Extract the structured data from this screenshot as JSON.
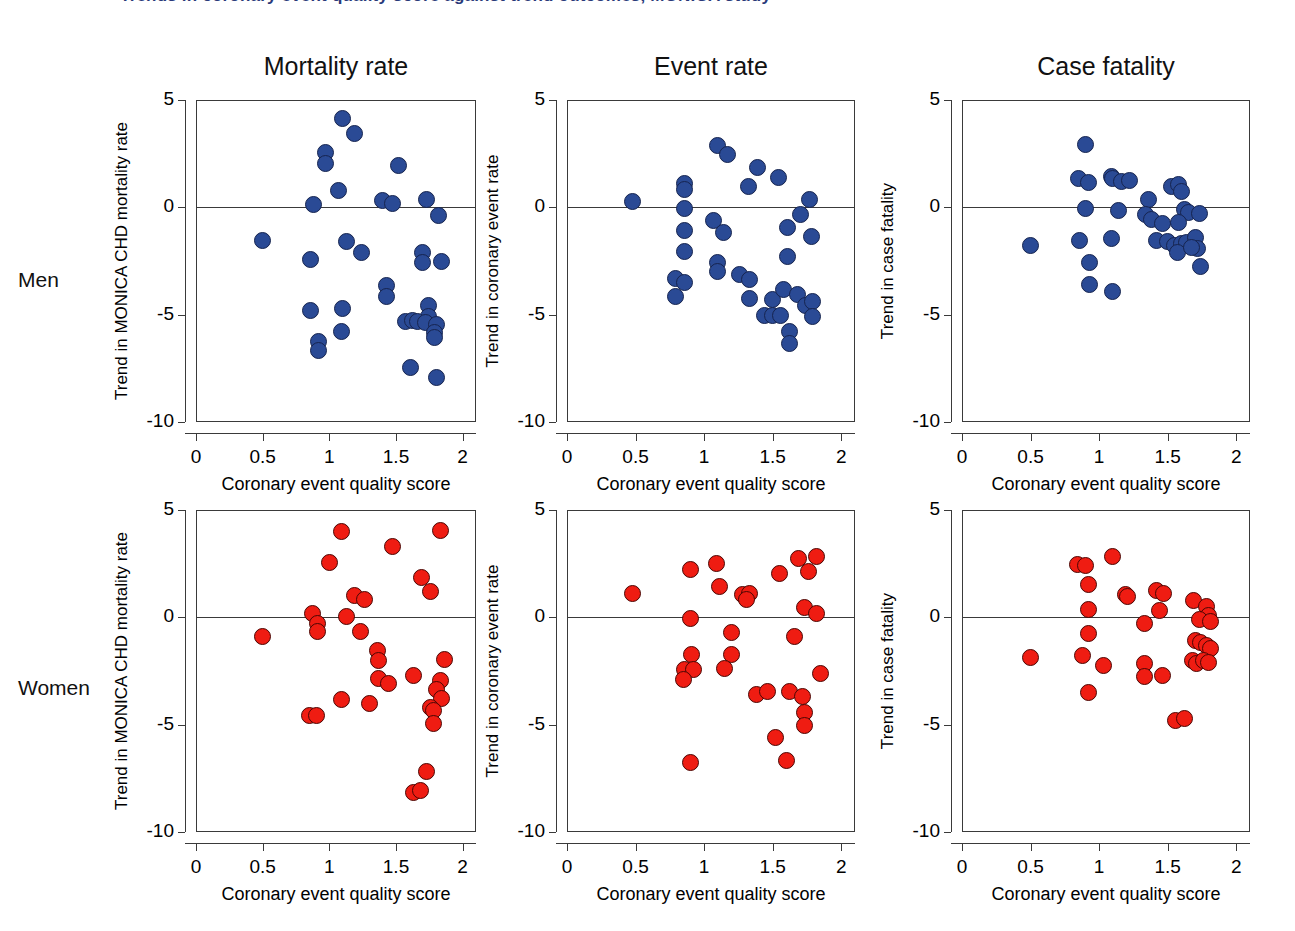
{
  "figure": {
    "clipped_title": "Trends in coronary event quality score against trend outcomes, MONICA study",
    "row_labels": [
      "Men",
      "Women"
    ],
    "column_titles": [
      "Mortality rate",
      "Event rate",
      "Case fatality"
    ],
    "colors": {
      "men": "#2a4a95",
      "men_edge": "#16244f",
      "women": "#ef1c12",
      "women_edge": "#4a0603",
      "axis": "#3a3a3a"
    }
  },
  "axes": {
    "xlabel": "Coronary event quality score",
    "xticks": [
      "0",
      "0.5",
      "1",
      "1.5",
      "2"
    ],
    "xtick_values": [
      0,
      0.5,
      1,
      1.5,
      2
    ],
    "xlim": [
      0,
      2.1
    ],
    "yticks": [
      "5",
      "0",
      "-5",
      "-10"
    ],
    "ytick_values": [
      5,
      0,
      -5,
      -10
    ],
    "ylim": [
      -10,
      5
    ],
    "ylabels": [
      "Trend in MONICA CHD mortality rate",
      "Trend in coronary event rate",
      "Trend in case fatality"
    ]
  },
  "chart_data": [
    {
      "type": "scatter",
      "title": "Mortality rate",
      "group": "Men",
      "color": "#2a4a95",
      "xlabel": "Coronary event quality score",
      "ylabel": "Trend in MONICA CHD mortality rate",
      "xlim": [
        0,
        2.1
      ],
      "ylim": [
        -10,
        5
      ],
      "grid": false,
      "legend": "none",
      "points": [
        {
          "x": 1.1,
          "y": 4.15
        },
        {
          "x": 1.19,
          "y": 3.45
        },
        {
          "x": 0.97,
          "y": 2.55
        },
        {
          "x": 0.97,
          "y": 2.05
        },
        {
          "x": 1.07,
          "y": 0.8
        },
        {
          "x": 1.52,
          "y": 1.95
        },
        {
          "x": 0.88,
          "y": 0.15
        },
        {
          "x": 1.4,
          "y": 0.3
        },
        {
          "x": 1.47,
          "y": 0.2
        },
        {
          "x": 1.73,
          "y": 0.35
        },
        {
          "x": 1.82,
          "y": -0.4
        },
        {
          "x": 0.5,
          "y": -1.55
        },
        {
          "x": 1.13,
          "y": -1.6
        },
        {
          "x": 1.24,
          "y": -2.1
        },
        {
          "x": 0.86,
          "y": -2.45
        },
        {
          "x": 1.7,
          "y": -2.1
        },
        {
          "x": 1.7,
          "y": -2.55
        },
        {
          "x": 1.84,
          "y": -2.5
        },
        {
          "x": 1.43,
          "y": -3.65
        },
        {
          "x": 1.43,
          "y": -4.15
        },
        {
          "x": 0.86,
          "y": -4.8
        },
        {
          "x": 1.1,
          "y": -4.7
        },
        {
          "x": 1.74,
          "y": -4.55
        },
        {
          "x": 1.74,
          "y": -5.1
        },
        {
          "x": 1.57,
          "y": -5.3
        },
        {
          "x": 1.62,
          "y": -5.25
        },
        {
          "x": 1.66,
          "y": -5.3
        },
        {
          "x": 1.72,
          "y": -5.35
        },
        {
          "x": 1.8,
          "y": -5.45
        },
        {
          "x": 1.79,
          "y": -5.85
        },
        {
          "x": 1.79,
          "y": -6.05
        },
        {
          "x": 0.92,
          "y": -6.25
        },
        {
          "x": 0.92,
          "y": -6.65
        },
        {
          "x": 1.09,
          "y": -5.8
        },
        {
          "x": 1.61,
          "y": -7.45
        },
        {
          "x": 1.8,
          "y": -7.95
        }
      ]
    },
    {
      "type": "scatter",
      "title": "Event rate",
      "group": "Men",
      "color": "#2a4a95",
      "xlabel": "Coronary event quality score",
      "ylabel": "Trend in coronary event rate",
      "xlim": [
        0,
        2.1
      ],
      "ylim": [
        -10,
        5
      ],
      "grid": false,
      "legend": "none",
      "points": [
        {
          "x": 1.1,
          "y": 2.9
        },
        {
          "x": 1.17,
          "y": 2.45
        },
        {
          "x": 1.39,
          "y": 1.85
        },
        {
          "x": 1.54,
          "y": 1.4
        },
        {
          "x": 1.32,
          "y": 0.95
        },
        {
          "x": 0.86,
          "y": 1.1
        },
        {
          "x": 0.86,
          "y": 0.85
        },
        {
          "x": 1.77,
          "y": 0.35
        },
        {
          "x": 0.48,
          "y": 0.25
        },
        {
          "x": 0.86,
          "y": -0.05
        },
        {
          "x": 1.7,
          "y": -0.35
        },
        {
          "x": 1.07,
          "y": -0.6
        },
        {
          "x": 0.86,
          "y": -1.1
        },
        {
          "x": 1.14,
          "y": -1.15
        },
        {
          "x": 1.61,
          "y": -0.95
        },
        {
          "x": 1.78,
          "y": -1.35
        },
        {
          "x": 0.86,
          "y": -2.05
        },
        {
          "x": 1.61,
          "y": -2.3
        },
        {
          "x": 1.1,
          "y": -2.55
        },
        {
          "x": 1.1,
          "y": -3.0
        },
        {
          "x": 0.79,
          "y": -3.3
        },
        {
          "x": 0.86,
          "y": -3.5
        },
        {
          "x": 1.26,
          "y": -3.15
        },
        {
          "x": 1.33,
          "y": -3.35
        },
        {
          "x": 0.79,
          "y": -4.15
        },
        {
          "x": 1.33,
          "y": -4.25
        },
        {
          "x": 1.5,
          "y": -4.3
        },
        {
          "x": 1.58,
          "y": -3.85
        },
        {
          "x": 1.68,
          "y": -4.05
        },
        {
          "x": 1.74,
          "y": -4.55
        },
        {
          "x": 1.79,
          "y": -4.4
        },
        {
          "x": 1.44,
          "y": -5.05
        },
        {
          "x": 1.5,
          "y": -5.05
        },
        {
          "x": 1.56,
          "y": -5.05
        },
        {
          "x": 1.79,
          "y": -5.1
        },
        {
          "x": 1.62,
          "y": -5.8
        },
        {
          "x": 1.62,
          "y": -6.35
        }
      ]
    },
    {
      "type": "scatter",
      "title": "Case fatality",
      "group": "Men",
      "color": "#2a4a95",
      "xlabel": "Coronary event quality score",
      "ylabel": "Trend in case fatality",
      "xlim": [
        0,
        2.1
      ],
      "ylim": [
        -10,
        5
      ],
      "grid": false,
      "legend": "none",
      "points": [
        {
          "x": 0.9,
          "y": 2.95
        },
        {
          "x": 1.09,
          "y": 1.45
        },
        {
          "x": 1.1,
          "y": 1.35
        },
        {
          "x": 1.16,
          "y": 1.2
        },
        {
          "x": 1.22,
          "y": 1.25
        },
        {
          "x": 0.85,
          "y": 1.35
        },
        {
          "x": 0.92,
          "y": 1.15
        },
        {
          "x": 1.53,
          "y": 0.95
        },
        {
          "x": 1.58,
          "y": 1.05
        },
        {
          "x": 1.6,
          "y": 0.75
        },
        {
          "x": 1.36,
          "y": 0.35
        },
        {
          "x": 0.9,
          "y": -0.05
        },
        {
          "x": 1.14,
          "y": -0.15
        },
        {
          "x": 1.34,
          "y": -0.35
        },
        {
          "x": 1.38,
          "y": -0.55
        },
        {
          "x": 1.62,
          "y": -0.1
        },
        {
          "x": 1.65,
          "y": -0.25
        },
        {
          "x": 1.73,
          "y": -0.3
        },
        {
          "x": 1.46,
          "y": -0.75
        },
        {
          "x": 1.58,
          "y": -0.7
        },
        {
          "x": 0.5,
          "y": -1.8
        },
        {
          "x": 0.86,
          "y": -1.55
        },
        {
          "x": 1.09,
          "y": -1.45
        },
        {
          "x": 1.42,
          "y": -1.55
        },
        {
          "x": 1.5,
          "y": -1.6
        },
        {
          "x": 1.55,
          "y": -1.8
        },
        {
          "x": 1.6,
          "y": -1.7
        },
        {
          "x": 1.64,
          "y": -1.65
        },
        {
          "x": 1.7,
          "y": -1.4
        },
        {
          "x": 1.72,
          "y": -1.9
        },
        {
          "x": 1.57,
          "y": -2.1
        },
        {
          "x": 1.67,
          "y": -1.85
        },
        {
          "x": 1.74,
          "y": -2.75
        },
        {
          "x": 0.93,
          "y": -2.55
        },
        {
          "x": 0.93,
          "y": -3.6
        },
        {
          "x": 1.1,
          "y": -3.9
        }
      ]
    },
    {
      "type": "scatter",
      "title": "Mortality rate",
      "group": "Women",
      "color": "#ef1c12",
      "xlabel": "Coronary event quality score",
      "ylabel": "Trend in MONICA CHD mortality rate",
      "xlim": [
        0,
        2.1
      ],
      "ylim": [
        -10,
        5
      ],
      "grid": false,
      "legend": "none",
      "points": [
        {
          "x": 1.09,
          "y": 4.0
        },
        {
          "x": 1.83,
          "y": 4.05
        },
        {
          "x": 1.47,
          "y": 3.3
        },
        {
          "x": 1.0,
          "y": 2.55
        },
        {
          "x": 1.69,
          "y": 1.85
        },
        {
          "x": 1.76,
          "y": 1.2
        },
        {
          "x": 1.19,
          "y": 1.0
        },
        {
          "x": 1.26,
          "y": 0.85
        },
        {
          "x": 0.87,
          "y": 0.2
        },
        {
          "x": 1.13,
          "y": 0.05
        },
        {
          "x": 0.91,
          "y": -0.3
        },
        {
          "x": 0.91,
          "y": -0.65
        },
        {
          "x": 1.23,
          "y": -0.65
        },
        {
          "x": 0.5,
          "y": -0.9
        },
        {
          "x": 1.36,
          "y": -1.55
        },
        {
          "x": 1.37,
          "y": -2.0
        },
        {
          "x": 1.86,
          "y": -1.95
        },
        {
          "x": 1.37,
          "y": -2.85
        },
        {
          "x": 1.44,
          "y": -3.1
        },
        {
          "x": 1.63,
          "y": -2.7
        },
        {
          "x": 1.83,
          "y": -2.95
        },
        {
          "x": 1.8,
          "y": -3.35
        },
        {
          "x": 1.84,
          "y": -3.8
        },
        {
          "x": 1.76,
          "y": -4.2
        },
        {
          "x": 1.78,
          "y": -4.35
        },
        {
          "x": 1.09,
          "y": -3.85
        },
        {
          "x": 0.85,
          "y": -4.55
        },
        {
          "x": 0.9,
          "y": -4.55
        },
        {
          "x": 1.3,
          "y": -4.0
        },
        {
          "x": 1.78,
          "y": -4.95
        },
        {
          "x": 1.73,
          "y": -7.2
        },
        {
          "x": 1.63,
          "y": -8.15
        },
        {
          "x": 1.68,
          "y": -8.05
        }
      ]
    },
    {
      "type": "scatter",
      "title": "Event rate",
      "group": "Women",
      "color": "#ef1c12",
      "xlabel": "Coronary event quality score",
      "ylabel": "Trend in coronary event rate",
      "xlim": [
        0,
        2.1
      ],
      "ylim": [
        -10,
        5
      ],
      "grid": false,
      "legend": "none",
      "points": [
        {
          "x": 1.69,
          "y": 2.75
        },
        {
          "x": 1.82,
          "y": 2.85
        },
        {
          "x": 1.09,
          "y": 2.5
        },
        {
          "x": 0.9,
          "y": 2.25
        },
        {
          "x": 1.76,
          "y": 2.15
        },
        {
          "x": 1.55,
          "y": 2.05
        },
        {
          "x": 1.11,
          "y": 1.45
        },
        {
          "x": 1.28,
          "y": 1.05
        },
        {
          "x": 1.33,
          "y": 1.1
        },
        {
          "x": 1.31,
          "y": 0.85
        },
        {
          "x": 0.48,
          "y": 1.1
        },
        {
          "x": 1.73,
          "y": 0.45
        },
        {
          "x": 1.82,
          "y": 0.2
        },
        {
          "x": 0.9,
          "y": -0.05
        },
        {
          "x": 1.2,
          "y": -0.7
        },
        {
          "x": 1.66,
          "y": -0.9
        },
        {
          "x": 0.91,
          "y": -1.75
        },
        {
          "x": 1.2,
          "y": -1.75
        },
        {
          "x": 0.86,
          "y": -2.45
        },
        {
          "x": 0.92,
          "y": -2.45
        },
        {
          "x": 1.15,
          "y": -2.4
        },
        {
          "x": 0.85,
          "y": -2.9
        },
        {
          "x": 1.85,
          "y": -2.6
        },
        {
          "x": 1.38,
          "y": -3.6
        },
        {
          "x": 1.46,
          "y": -3.45
        },
        {
          "x": 1.62,
          "y": -3.45
        },
        {
          "x": 1.72,
          "y": -3.7
        },
        {
          "x": 1.73,
          "y": -4.45
        },
        {
          "x": 1.73,
          "y": -5.05
        },
        {
          "x": 1.52,
          "y": -5.6
        },
        {
          "x": 0.9,
          "y": -6.75
        },
        {
          "x": 1.6,
          "y": -6.65
        }
      ]
    },
    {
      "type": "scatter",
      "title": "Case fatality",
      "group": "Women",
      "color": "#ef1c12",
      "xlabel": "Coronary event quality score",
      "ylabel": "Trend in case fatality",
      "xlim": [
        0,
        2.1
      ],
      "ylim": [
        -10,
        5
      ],
      "grid": false,
      "legend": "none",
      "points": [
        {
          "x": 1.1,
          "y": 2.85
        },
        {
          "x": 0.84,
          "y": 2.45
        },
        {
          "x": 0.9,
          "y": 2.4
        },
        {
          "x": 0.92,
          "y": 1.55
        },
        {
          "x": 1.42,
          "y": 1.25
        },
        {
          "x": 1.19,
          "y": 1.05
        },
        {
          "x": 1.21,
          "y": 0.95
        },
        {
          "x": 1.47,
          "y": 1.1
        },
        {
          "x": 1.69,
          "y": 0.8
        },
        {
          "x": 1.78,
          "y": 0.5
        },
        {
          "x": 0.92,
          "y": 0.35
        },
        {
          "x": 1.44,
          "y": 0.3
        },
        {
          "x": 1.8,
          "y": 0.1
        },
        {
          "x": 1.73,
          "y": -0.1
        },
        {
          "x": 1.81,
          "y": -0.2
        },
        {
          "x": 1.33,
          "y": -0.3
        },
        {
          "x": 0.92,
          "y": -0.75
        },
        {
          "x": 1.7,
          "y": -1.1
        },
        {
          "x": 1.74,
          "y": -1.15
        },
        {
          "x": 1.78,
          "y": -1.3
        },
        {
          "x": 1.81,
          "y": -1.45
        },
        {
          "x": 0.5,
          "y": -1.85
        },
        {
          "x": 0.88,
          "y": -1.8
        },
        {
          "x": 1.03,
          "y": -2.25
        },
        {
          "x": 1.33,
          "y": -2.15
        },
        {
          "x": 1.68,
          "y": -2.0
        },
        {
          "x": 1.71,
          "y": -2.15
        },
        {
          "x": 1.76,
          "y": -2.0
        },
        {
          "x": 1.8,
          "y": -2.1
        },
        {
          "x": 1.33,
          "y": -2.75
        },
        {
          "x": 1.46,
          "y": -2.7
        },
        {
          "x": 0.92,
          "y": -3.5
        },
        {
          "x": 1.56,
          "y": -4.8
        },
        {
          "x": 1.62,
          "y": -4.7
        }
      ]
    }
  ]
}
